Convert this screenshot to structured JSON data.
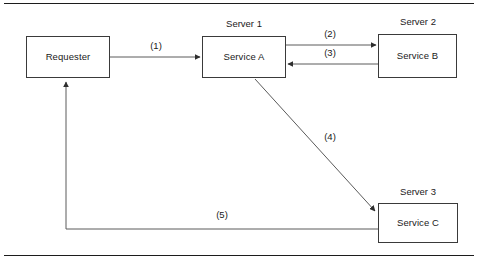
{
  "figure": {
    "background": "#ffffff",
    "line_color": "#3a3a3a",
    "rule_color": "#1c1c1c",
    "text_color": "#1a1a1a"
  },
  "rules": {
    "top_label": "top-rule",
    "bottom_label": "bottom-rule"
  },
  "nodes": [
    {
      "id": "requester",
      "label": "Requester",
      "server": null,
      "x": 26,
      "y": 36,
      "w": 84,
      "h": 42
    },
    {
      "id": "service-a",
      "label": "Service A",
      "server": "Server 1",
      "x": 202,
      "y": 36,
      "w": 84,
      "h": 42
    },
    {
      "id": "service-b",
      "label": "Service B",
      "server": "Server 2",
      "x": 378,
      "y": 34,
      "w": 79,
      "h": 44
    },
    {
      "id": "service-c",
      "label": "Service C",
      "server": "Server 3",
      "x": 378,
      "y": 203,
      "w": 80,
      "h": 40
    }
  ],
  "server_labels": [
    {
      "id": "server-1",
      "text": "Server 1",
      "cx": 244,
      "y": 19
    },
    {
      "id": "server-2",
      "text": "Server 2",
      "cx": 418,
      "y": 17
    },
    {
      "id": "server-3",
      "text": "Server 3",
      "cx": 418,
      "y": 187
    }
  ],
  "edges": [
    {
      "id": "edge-1",
      "label": "(1)",
      "from": "requester",
      "to": "service-a",
      "direction": "right",
      "label_cx": 156,
      "label_y": 41
    },
    {
      "id": "edge-2",
      "label": "(2)",
      "from": "service-a",
      "to": "service-b",
      "direction": "right",
      "label_cx": 330,
      "label_y": 29
    },
    {
      "id": "edge-3",
      "label": "(3)",
      "from": "service-b",
      "to": "service-a",
      "direction": "left",
      "label_cx": 330,
      "label_y": 48
    },
    {
      "id": "edge-4",
      "label": "(4)",
      "from": "service-a",
      "to": "service-c",
      "direction": "diagonal-down-right",
      "label_cx": 330,
      "label_y": 132
    },
    {
      "id": "edge-5",
      "label": "(5)",
      "from": "service-c",
      "to": "requester",
      "direction": "elbow-left-up",
      "label_cx": 222,
      "label_y": 210
    }
  ]
}
